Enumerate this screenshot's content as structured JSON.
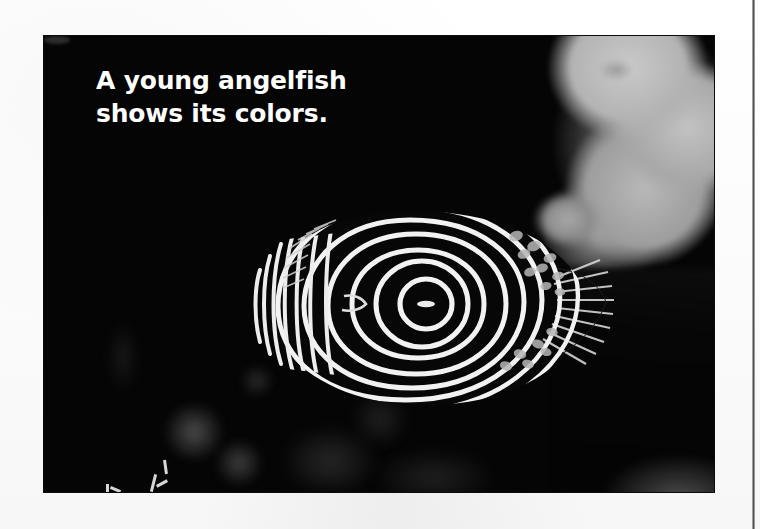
{
  "page": {
    "background_color": "#fcfcfc",
    "column_rule_color": "#4a4a4a"
  },
  "photo": {
    "name": "angelfish-underwater-photo",
    "background_color": "#050505",
    "subject": "juvenile-emperor-angelfish",
    "caption": {
      "line1": "A young angelfish",
      "line2": "shows its colors.",
      "color": "#ffffff"
    },
    "scene_elements": [
      {
        "name": "coral-mass",
        "tone": "#b3b3b3",
        "position": "upper-right"
      },
      {
        "name": "dark-rock",
        "tone": "#070707",
        "position": "lower-right"
      },
      {
        "name": "out-of-focus-blobs",
        "tone": "#8a8a8a",
        "position": "lower-left"
      },
      {
        "name": "coral-sprig",
        "tone": "#d6d6d6",
        "position": "bottom-left"
      }
    ],
    "fish": {
      "stripe_color": "#f4f4f4",
      "body_color": "#070707",
      "pattern": "concentric-white-rings",
      "ring_count": 8,
      "eye_spot_center": "spiral-center"
    }
  }
}
